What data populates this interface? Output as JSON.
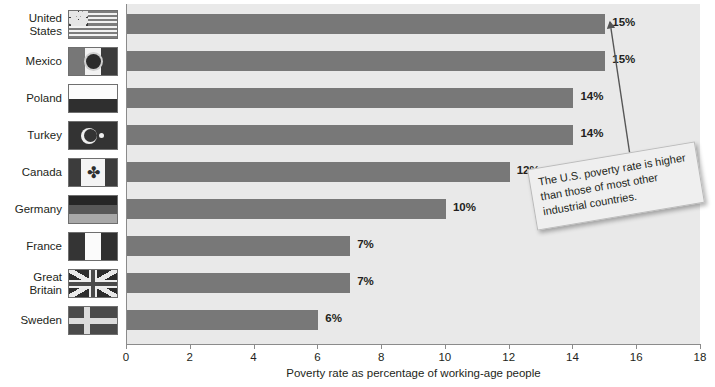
{
  "chart_data": {
    "type": "bar",
    "orientation": "horizontal",
    "title": "",
    "xlabel": "Poverty rate as percentage of working-age people",
    "ylabel": "",
    "xlim": [
      0,
      18
    ],
    "xticks": [
      0,
      2,
      4,
      6,
      8,
      10,
      12,
      14,
      16,
      18
    ],
    "grid": false,
    "legend": null,
    "categories": [
      "United States",
      "Mexico",
      "Poland",
      "Turkey",
      "Canada",
      "Germany",
      "France",
      "Great Britain",
      "Sweden"
    ],
    "values": [
      15,
      15,
      14,
      14,
      12,
      10,
      7,
      7,
      6
    ],
    "value_labels": [
      "15%",
      "15%",
      "14%",
      "14%",
      "12%",
      "10%",
      "7%",
      "7%",
      "6%"
    ],
    "annotations": [
      {
        "text": "The U.S. poverty rate is higher than those of most other industrial countries.",
        "points_to": "United States"
      }
    ],
    "colors": {
      "bar": "#787878",
      "plot_background": "#e9e9e9",
      "page_background": "#ffffff",
      "axis": "#8b8b8b",
      "text": "#231f20",
      "callout_background": "#efefef",
      "callout_border": "#b9b9b9"
    }
  },
  "rows": [
    {
      "label_line1": "United",
      "label_line2": "States",
      "flag": "flag-united-states",
      "value": 15,
      "value_label": "15%"
    },
    {
      "label_line1": "Mexico",
      "label_line2": "",
      "flag": "flag-mexico",
      "value": 15,
      "value_label": "15%"
    },
    {
      "label_line1": "Poland",
      "label_line2": "",
      "flag": "flag-poland",
      "value": 14,
      "value_label": "14%"
    },
    {
      "label_line1": "Turkey",
      "label_line2": "",
      "flag": "flag-turkey",
      "value": 14,
      "value_label": "14%"
    },
    {
      "label_line1": "Canada",
      "label_line2": "",
      "flag": "flag-canada",
      "value": 12,
      "value_label": "12%"
    },
    {
      "label_line1": "Germany",
      "label_line2": "",
      "flag": "flag-germany",
      "value": 10,
      "value_label": "10%"
    },
    {
      "label_line1": "France",
      "label_line2": "",
      "flag": "flag-france",
      "value": 7,
      "value_label": "7%"
    },
    {
      "label_line1": "Great Britain",
      "label_line2": "",
      "flag": "flag-great-britain",
      "value": 7,
      "value_label": "7%"
    },
    {
      "label_line1": "Sweden",
      "label_line2": "",
      "flag": "flag-sweden",
      "value": 6,
      "value_label": "6%"
    }
  ],
  "axis": {
    "ticks": [
      "0",
      "2",
      "4",
      "6",
      "8",
      "10",
      "12",
      "14",
      "16",
      "18"
    ],
    "title": "Poverty rate as percentage of working-age people"
  },
  "callout": {
    "text": "The U.S. poverty rate is higher than those of most other industrial countries."
  },
  "icons": {
    "maple_leaf": "✤"
  }
}
